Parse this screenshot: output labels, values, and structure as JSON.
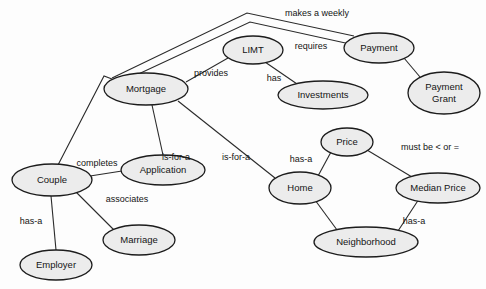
{
  "diagram": {
    "type": "entity-relationship-concept-map",
    "background_color": "#fdfdfd",
    "node_fill_color": "#ececec",
    "node_stroke_color": "#1c1c1c",
    "edge_color": "#2a2a2a",
    "text_color": "#141414",
    "nodes": [
      {
        "id": "mortgage",
        "label": "Mortgage",
        "cx": 146,
        "cy": 89,
        "rx": 42,
        "ry": 16
      },
      {
        "id": "limt",
        "label": "LIMT",
        "cx": 253,
        "cy": 50,
        "rx": 30,
        "ry": 14
      },
      {
        "id": "payment",
        "label": "Payment",
        "cx": 379,
        "cy": 48,
        "rx": 35,
        "ry": 15
      },
      {
        "id": "investments",
        "label": "Investments",
        "cx": 323,
        "cy": 95,
        "rx": 45,
        "ry": 14
      },
      {
        "id": "payment_grant",
        "label": "Payment\nGrant",
        "cx": 444,
        "cy": 93,
        "rx": 36,
        "ry": 21,
        "lines": [
          "Payment",
          "Grant"
        ]
      },
      {
        "id": "couple",
        "label": "Couple",
        "cx": 52,
        "cy": 180,
        "rx": 40,
        "ry": 16
      },
      {
        "id": "application",
        "label": "Application",
        "cx": 163,
        "cy": 170,
        "rx": 42,
        "ry": 15
      },
      {
        "id": "marriage",
        "label": "Marriage",
        "cx": 139,
        "cy": 240,
        "rx": 36,
        "ry": 15
      },
      {
        "id": "employer",
        "label": "Employer",
        "cx": 56,
        "cy": 265,
        "rx": 36,
        "ry": 15
      },
      {
        "id": "price",
        "label": "Price",
        "cx": 347,
        "cy": 142,
        "rx": 26,
        "ry": 14
      },
      {
        "id": "home",
        "label": "Home",
        "cx": 300,
        "cy": 188,
        "rx": 31,
        "ry": 16
      },
      {
        "id": "median_price",
        "label": "Median Price",
        "cx": 438,
        "cy": 188,
        "rx": 42,
        "ry": 15
      },
      {
        "id": "neighborhood",
        "label": "Neighborhood",
        "cx": 366,
        "cy": 242,
        "rx": 52,
        "ry": 15
      }
    ],
    "edges": [
      {
        "id": "e-mortgage-payment-weekly",
        "from": "mortgage",
        "to": "payment",
        "label": "makes a weekly",
        "points": "112,78 247,13 354,36",
        "label_x": 317,
        "label_y": 14
      },
      {
        "id": "e-mortgage-payment-requires",
        "from": "mortgage",
        "to": "payment",
        "label": "requires",
        "points": "117,84 250,22 350,44",
        "label_x": 311,
        "label_y": 47
      },
      {
        "id": "e-mortgage-limt-provides",
        "from": "mortgage",
        "to": "limt",
        "label": "provides",
        "points": "186,82 228,58",
        "label_x": 211,
        "label_y": 74
      },
      {
        "id": "e-limt-investments-has",
        "from": "limt",
        "to": "investments",
        "label": "has",
        "points": "265,62 300,86",
        "label_x": 274,
        "label_y": 79
      },
      {
        "id": "e-payment-grant",
        "from": "payment",
        "to": "payment_grant",
        "label": "",
        "points": "404,58 420,77",
        "label_x": 0,
        "label_y": 0
      },
      {
        "id": "e-mortgage-couple",
        "from": "mortgage",
        "to": "couple",
        "label": "",
        "points": "112,79 104,76 58,165",
        "label_x": 0,
        "label_y": 0
      },
      {
        "id": "e-mortgage-application",
        "from": "mortgage",
        "to": "application",
        "label": "is-for-a",
        "points": "152,105 163,155",
        "label_x": 176,
        "label_y": 158
      },
      {
        "id": "e-mortgage-home",
        "from": "mortgage",
        "to": "home",
        "label": "is-for-a",
        "points": "178,101 275,178",
        "label_x": 236,
        "label_y": 158
      },
      {
        "id": "e-couple-application",
        "from": "couple",
        "to": "application",
        "label": "completes",
        "points": "90,176 122,171",
        "label_x": 97,
        "label_y": 164
      },
      {
        "id": "e-couple-marriage",
        "from": "couple",
        "to": "marriage",
        "label": "associates",
        "points": "76,192 117,233",
        "label_x": 127,
        "label_y": 200
      },
      {
        "id": "e-couple-employer",
        "from": "couple",
        "to": "employer",
        "label": "has-a",
        "points": "51,196 56,250",
        "label_x": 31,
        "label_y": 222
      },
      {
        "id": "e-price-home",
        "from": "price",
        "to": "home",
        "label": "has-a",
        "points": "331,152 318,176",
        "label_x": 301,
        "label_y": 160
      },
      {
        "id": "e-price-median",
        "from": "price",
        "to": "median_price",
        "label": "must be < or =",
        "points": "367,150 412,177",
        "label_x": 430,
        "label_y": 148
      },
      {
        "id": "e-home-neighborhood",
        "from": "home",
        "to": "neighborhood",
        "label": "",
        "points": "315,200 340,234",
        "label_x": 0,
        "label_y": 0
      },
      {
        "id": "e-median-neighborhood",
        "from": "median_price",
        "to": "neighborhood",
        "label": "has-a",
        "points": "419,199 396,234",
        "label_x": 414,
        "label_y": 222
      }
    ]
  }
}
